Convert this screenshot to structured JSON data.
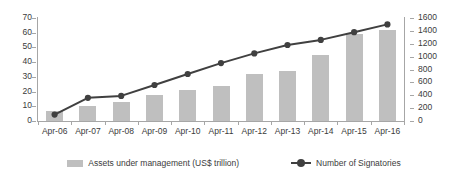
{
  "chart_data": {
    "type": "bar",
    "title": "",
    "xlabel": "",
    "categories": [
      "Apr-06",
      "Apr-07",
      "Apr-08",
      "Apr-09",
      "Apr-10",
      "Apr-11",
      "Apr-12",
      "Apr-13",
      "Apr-14",
      "Apr-15",
      "Apr-16"
    ],
    "grid": false,
    "legend_position": "bottom",
    "series": [
      {
        "name": "Assets under management (US$ trillion)",
        "type": "bar",
        "axis": "left",
        "color": "#bfbfbf",
        "values": [
          6.5,
          10,
          13,
          18,
          21,
          24,
          32,
          34,
          45,
          59,
          62
        ]
      },
      {
        "name": "Number of Signatories",
        "type": "line",
        "axis": "right",
        "color": "#404040",
        "marker": "circle",
        "values": [
          100,
          360,
          390,
          560,
          730,
          900,
          1050,
          1180,
          1260,
          1380,
          1500
        ]
      }
    ],
    "left_axis": {
      "label": "",
      "ylim": [
        0,
        70
      ],
      "ticks": [
        "0",
        "10",
        "20",
        "30",
        "40",
        "50",
        "60",
        "70"
      ]
    },
    "right_axis": {
      "label": "",
      "ylim": [
        0,
        1600
      ],
      "ticks": [
        "0",
        "200",
        "400",
        "600",
        "800",
        "1000",
        "1200",
        "1400",
        "1600"
      ]
    }
  },
  "legend": {
    "items": [
      {
        "label": "Assets under management (US$ trillion)"
      },
      {
        "label": "Number of Signatories"
      }
    ]
  },
  "colors": {
    "bar": "#bfbfbf",
    "line": "#404040",
    "axis": "#a6a6a6",
    "text": "#3b3b3b",
    "background": "#ffffff"
  }
}
